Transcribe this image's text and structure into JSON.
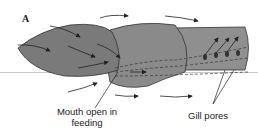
{
  "panel_label": "A",
  "labels": {
    "mouth": "Mouth open in feeding",
    "gill": "Gill pores"
  },
  "colors": {
    "body_fill": "#8c8c8c",
    "body_dark": "#6f6f6f",
    "arrow": "#222222"
  }
}
